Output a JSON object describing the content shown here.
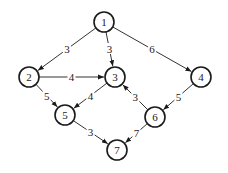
{
  "diagram": {
    "type": "directed weighted graph",
    "nodes": [
      {
        "id": "1",
        "label": "1",
        "x": 104,
        "y": 22
      },
      {
        "id": "2",
        "label": "2",
        "x": 29,
        "y": 77
      },
      {
        "id": "3",
        "label": "3",
        "x": 115,
        "y": 77
      },
      {
        "id": "4",
        "label": "4",
        "x": 201,
        "y": 77
      },
      {
        "id": "5",
        "label": "5",
        "x": 65,
        "y": 115
      },
      {
        "id": "6",
        "label": "6",
        "x": 155,
        "y": 117
      },
      {
        "id": "7",
        "label": "7",
        "x": 117,
        "y": 150
      }
    ],
    "edges": [
      {
        "from": "1",
        "to": "2",
        "weight": "3"
      },
      {
        "from": "1",
        "to": "3",
        "weight": "3"
      },
      {
        "from": "1",
        "to": "4",
        "weight": "6"
      },
      {
        "from": "2",
        "to": "3",
        "weight": "4"
      },
      {
        "from": "2",
        "to": "5",
        "weight": "5"
      },
      {
        "from": "3",
        "to": "5",
        "weight": "4"
      },
      {
        "from": "6",
        "to": "3",
        "weight": "3"
      },
      {
        "from": "4",
        "to": "6",
        "weight": "5"
      },
      {
        "from": "5",
        "to": "7",
        "weight": "3"
      },
      {
        "from": "6",
        "to": "7",
        "weight": "7"
      }
    ],
    "node_radius": 10
  }
}
